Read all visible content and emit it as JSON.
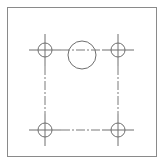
{
  "drawing": {
    "type": "plate-with-hole-pattern",
    "stroke_color": "#6e6e6e",
    "border": {
      "x": 7.5,
      "y": 7.5,
      "width": 149,
      "height": 149
    },
    "center_hole": {
      "cx": 82,
      "cy": 55,
      "r": 14
    },
    "bolt_holes": [
      {
        "name": "top-left",
        "cx": 45,
        "cy": 50,
        "r": 7
      },
      {
        "name": "top-right",
        "cx": 118,
        "cy": 50,
        "r": 7
      },
      {
        "name": "bottom-left",
        "cx": 45,
        "cy": 130,
        "r": 7
      },
      {
        "name": "bottom-right",
        "cx": 118,
        "cy": 130,
        "r": 7
      }
    ],
    "crosshair_extent": 16,
    "bolt_pattern": {
      "x1": 45,
      "y1": 50,
      "x2": 118,
      "y2": 130
    }
  }
}
